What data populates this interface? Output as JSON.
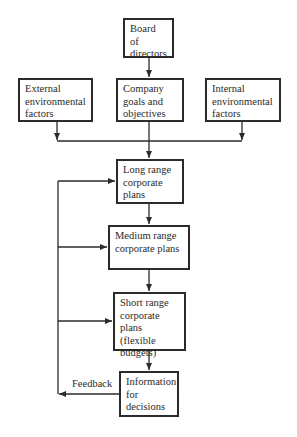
{
  "diagram": {
    "nodes": {
      "board": {
        "label": "Board of directors"
      },
      "external": {
        "label": "External environmental factors"
      },
      "goals": {
        "label": "Company goals and objectives"
      },
      "internal": {
        "label": "Internal environmental factors"
      },
      "long": {
        "label": "Long range corporate plans"
      },
      "medium": {
        "label": "Medium range corporate plans"
      },
      "short": {
        "label": "Short range corporate plans (flexible budgets)"
      },
      "info": {
        "label": "Information for decisions"
      }
    },
    "edges": [
      {
        "from": "board",
        "to": "goals"
      },
      {
        "from": "external",
        "to": "long"
      },
      {
        "from": "goals",
        "to": "long"
      },
      {
        "from": "internal",
        "to": "long"
      },
      {
        "from": "long",
        "to": "medium"
      },
      {
        "from": "medium",
        "to": "short"
      },
      {
        "from": "short",
        "to": "info"
      },
      {
        "from": "info",
        "to": "long",
        "label": "Feedback"
      },
      {
        "from": "info",
        "to": "medium",
        "label": "Feedback"
      },
      {
        "from": "info",
        "to": "short",
        "label": "Feedback"
      }
    ],
    "feedback_label": "Feedback"
  }
}
